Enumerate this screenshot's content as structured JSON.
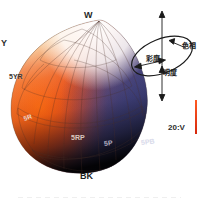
{
  "figure": {
    "caption": ""
  },
  "solid": {
    "poles": {
      "white_label": "W",
      "black_label": "BK"
    },
    "hue_labels": [
      {
        "key": "y",
        "text": "Y"
      },
      {
        "key": "5yr",
        "text": "5YR"
      },
      {
        "key": "5r",
        "text": "5R"
      },
      {
        "key": "5rp",
        "text": "5RP"
      },
      {
        "key": "5p",
        "text": "5P"
      },
      {
        "key": "5pb",
        "text": "5PB"
      }
    ],
    "axis_label": "20:V",
    "colors": {
      "white": "#ffffff",
      "yellow": "#f2dca0",
      "orange": "#ef7b2a",
      "red": "#e03c14",
      "purple": "#5b4b7a",
      "blue_purple": "#3a3f72",
      "black": "#141018",
      "mesh": "#5a4038"
    }
  },
  "schematic": {
    "hue_label": "色相",
    "chroma_label": "彩度",
    "value_label": "明度",
    "line_color": "#1a1a1a"
  },
  "accent": {
    "red_bar_color": "#ff5a22"
  }
}
